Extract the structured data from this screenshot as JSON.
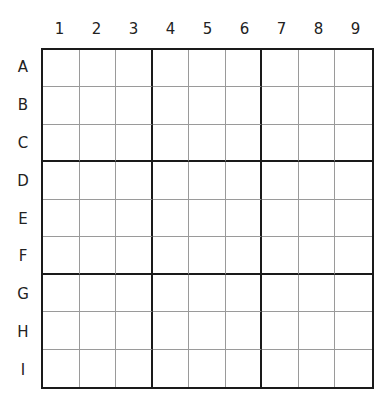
{
  "puzzle": {
    "column_labels": [
      "1",
      "2",
      "3",
      "4",
      "5",
      "6",
      "7",
      "8",
      "9"
    ],
    "row_labels": [
      "A",
      "B",
      "C",
      "D",
      "E",
      "F",
      "G",
      "H",
      "I"
    ],
    "cells": [
      [
        "",
        "",
        "",
        "",
        "",
        "",
        "",
        "",
        ""
      ],
      [
        "",
        "",
        "",
        "",
        "",
        "",
        "",
        "",
        ""
      ],
      [
        "",
        "",
        "",
        "",
        "",
        "",
        "",
        "",
        ""
      ],
      [
        "",
        "",
        "",
        "",
        "",
        "",
        "",
        "",
        ""
      ],
      [
        "",
        "",
        "",
        "",
        "",
        "",
        "",
        "",
        ""
      ],
      [
        "",
        "",
        "",
        "",
        "",
        "",
        "",
        "",
        ""
      ],
      [
        "",
        "",
        "",
        "",
        "",
        "",
        "",
        "",
        ""
      ],
      [
        "",
        "",
        "",
        "",
        "",
        "",
        "",
        "",
        ""
      ],
      [
        "",
        "",
        "",
        "",
        "",
        "",
        "",
        "",
        ""
      ]
    ]
  },
  "colors": {
    "thick_line": "#1a1a1a",
    "thin_line": "#9a9a9a",
    "background": "#ffffff"
  }
}
